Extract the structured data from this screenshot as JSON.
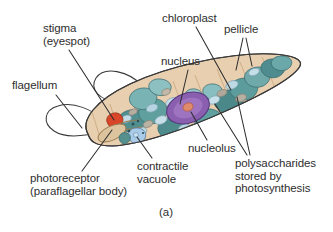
{
  "figure": {
    "caption": "(a)"
  },
  "labels": {
    "stigma": "stigma\n(eyespot)",
    "flagellum": "flagellum",
    "photoreceptor": "photoreceptor\n(paraflagellar body)",
    "chloroplast": "chloroplast",
    "pellicle": "pellicle",
    "nucleus": "nucleus",
    "nucleolus": "nucleolus",
    "contractile_vacuole": "contractile\nvacuole",
    "polysaccharides": "polysaccharides\nstored by\nphotosynthesis"
  },
  "colors": {
    "cytoplasm": "#e8cfb0",
    "cytoplasm_light": "#f0ddc4",
    "outline": "#3a3a3a",
    "chloroplast_dark": "#4e8f92",
    "chloroplast_mid": "#6fb0ae",
    "chloroplast_light": "#a8cfd2",
    "granule_blue": "#b7d4e0",
    "granule_gray": "#b9b2a6",
    "nucleus": "#8a5fb0",
    "nucleus_rim": "#5d3c86",
    "nucleolus": "#e0866a",
    "stigma": "#d9462a",
    "vacuole": "#a9cbe8",
    "text": "#2e2e2e",
    "flagellum_line": "#3a3a3a"
  }
}
